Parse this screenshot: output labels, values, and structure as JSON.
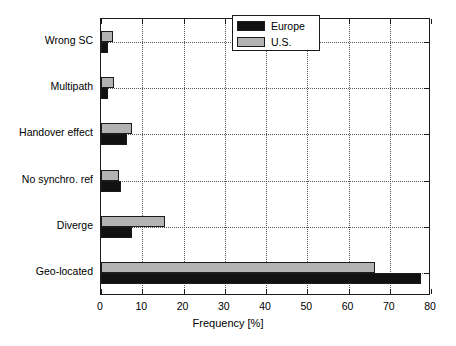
{
  "chart_data": {
    "type": "bar",
    "orientation": "horizontal",
    "title": "",
    "xlabel": "Frequency [%]",
    "ylabel": "",
    "xlim": [
      0,
      80
    ],
    "xticks": [
      0,
      10,
      20,
      30,
      40,
      50,
      60,
      70,
      80
    ],
    "xticklabels": [
      "0",
      "10",
      "20",
      "30",
      "40",
      "50",
      "60",
      "70",
      "80"
    ],
    "grid": true,
    "categories": [
      "Wrong SC",
      "Multipath",
      "Handover effect",
      "No synchro. ref",
      "Diverge",
      "Geo-located"
    ],
    "series": [
      {
        "name": "Europe",
        "color": "#111111",
        "values": [
          1.7,
          1.7,
          6.2,
          4.8,
          7.6,
          77.5
        ]
      },
      {
        "name": "U.S.",
        "color": "#b3b3b3",
        "values": [
          2.9,
          3.1,
          7.4,
          4.4,
          15.5,
          66.5
        ]
      }
    ],
    "legend": {
      "position": "upper right",
      "entries": [
        {
          "label": "Europe",
          "color": "#111111"
        },
        {
          "label": "U.S.",
          "color": "#b3b3b3"
        }
      ]
    }
  },
  "axis": {
    "x_title": "Frequency [%]"
  },
  "colors": {
    "europe": "#111111",
    "us": "#b3b3b3",
    "frame": "#1a1a1a",
    "grid": "#555555",
    "background": "#ffffff"
  }
}
